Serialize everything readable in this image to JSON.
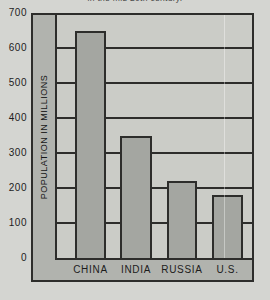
{
  "caption": {
    "text": "in the mid 20th century.",
    "visibility": "partially cut off at top edge"
  },
  "chart_data": {
    "type": "bar",
    "categories": [
      "CHINA",
      "INDIA",
      "RUSSIA",
      "U.S."
    ],
    "values": [
      650,
      350,
      220,
      180
    ],
    "title": "",
    "xlabel": "",
    "ylabel": "POPULATION IN MILLIONS",
    "ylim": [
      0,
      700
    ],
    "ytick_step": 100,
    "yticks": [
      700,
      600,
      500,
      400,
      300,
      200,
      100,
      0
    ],
    "grid": true,
    "legend": "none"
  },
  "colors": {
    "page_bg": "#d4d5d1",
    "chart_interior": "#b1b3ae",
    "plot_bg": "#cbccc7",
    "bar_fill": "#a4a6a1",
    "line": "#2d2d2b",
    "text": "#1c1c1c"
  }
}
